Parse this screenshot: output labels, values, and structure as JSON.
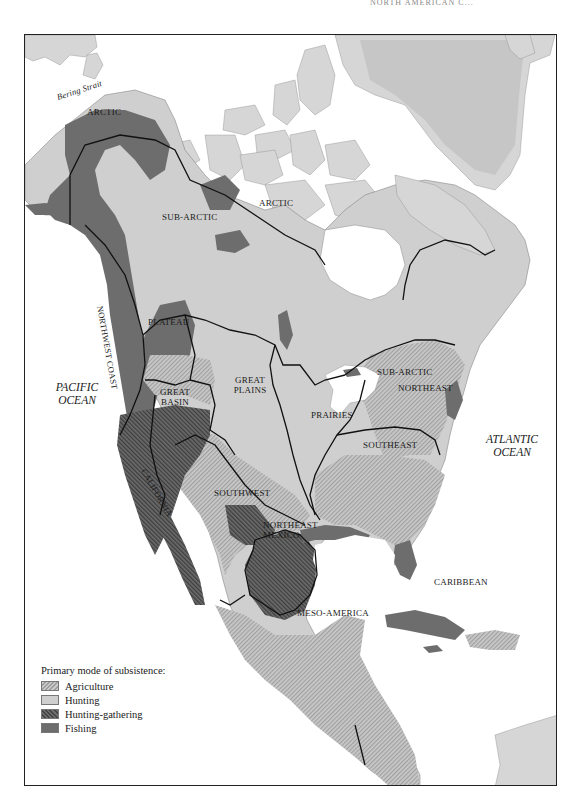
{
  "running_head": "NORTH AMERICAN C...",
  "map": {
    "colors": {
      "land_other": "#d6d6d6",
      "hunting": "#cfcfcf",
      "fishing": "#6d6d6d",
      "agriculture_light": "#c9c9c9",
      "agriculture_dark": "#9e9e9e",
      "hunting_gathering_light": "#6c6c6c",
      "hunting_gathering_dark": "#444444",
      "boundary": "#111111",
      "water": "#ffffff"
    },
    "labels": {
      "bering_strait": "Bering Strait",
      "arctic_west": "ARCTIC",
      "arctic_east": "ARCTIC",
      "sub_arctic_west": "SUB-ARCTIC",
      "sub_arctic_east": "SUB-ARCTIC",
      "northwest_coast": "NORTHWEST COAST",
      "plateau": "PLATEAU",
      "great_basin": "GREAT BASIN",
      "great_plains": "GREAT PLAINS",
      "prairies": "PRAIRIES",
      "northeast": "NORTHEAST",
      "southeast": "SOUTHEAST",
      "california": "CALIFORNIA",
      "southwest": "SOUTHWEST",
      "northeast_mexico": "NORTHEAST MEXICO",
      "meso_america": "MESO-AMERICA",
      "caribbean": "CARIBBEAN"
    },
    "oceans": {
      "pacific": "PACIFIC OCEAN",
      "atlantic": "ATLANTIC OCEAN"
    },
    "legend": {
      "title": "Primary mode of subsistence:",
      "items": [
        {
          "label": "Agriculture",
          "pattern": "hatched-light"
        },
        {
          "label": "Hunting",
          "pattern": "solid-light"
        },
        {
          "label": "Hunting-gathering",
          "pattern": "hatched-dark"
        },
        {
          "label": "Fishing",
          "pattern": "solid-dark"
        }
      ]
    }
  }
}
